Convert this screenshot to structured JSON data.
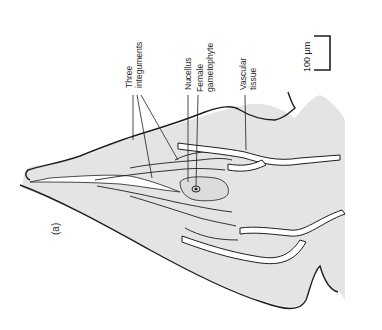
{
  "figure": {
    "panel_label": "(a)",
    "labels": {
      "three_integuments_line1": "Three",
      "three_integuments_line2": "integuments",
      "nucellus": "Nucellus",
      "female_gametophyte_line1": "Female",
      "female_gametophyte_line2": "gametophyte",
      "vascular_tissue_line1": "Vascular",
      "vascular_tissue_line2": "tissue"
    },
    "scale_bar": {
      "label": "100 μm"
    },
    "colors": {
      "tissue_fill": "#e4e4e4",
      "outline": "#1e1e1e",
      "background": "#ffffff",
      "vascular_hatch": "#ffffff"
    }
  }
}
